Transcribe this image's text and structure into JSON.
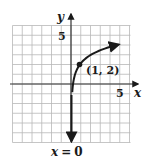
{
  "chart_data": {
    "type": "line",
    "title": "",
    "xlabel": "x",
    "ylabel": "y",
    "xlim": [
      -6,
      6
    ],
    "ylim": [
      -6,
      6
    ],
    "grid": true,
    "x_tick_labels": [
      {
        "value": 5,
        "label": "5"
      }
    ],
    "y_tick_labels": [
      {
        "value": 5,
        "label": "5"
      }
    ],
    "series": [
      {
        "name": "y = 2 + log2(x)",
        "points": [
          [
            0.03,
            -6
          ],
          [
            0.0625,
            -2
          ],
          [
            0.125,
            -1
          ],
          [
            0.25,
            0
          ],
          [
            0.5,
            1
          ],
          [
            1,
            2
          ],
          [
            2,
            3
          ],
          [
            4,
            4
          ],
          [
            5.5,
            4.46
          ]
        ],
        "marked_point": {
          "x": 1,
          "y": 2,
          "label": "(1, 2)"
        }
      }
    ],
    "asymptote": {
      "type": "vertical",
      "x": 0,
      "label": "x = 0"
    },
    "annotations": [
      "(1, 2)",
      "x = 0"
    ]
  },
  "labels": {
    "x_axis": "x",
    "y_axis": "y",
    "x_tick": "5",
    "y_tick": "5",
    "point": "(1, 2)",
    "asymptote": "x = 0"
  },
  "colors": {
    "grid": "#b8b8b8",
    "axis": "#333333",
    "curve": "#1a1a1a"
  }
}
